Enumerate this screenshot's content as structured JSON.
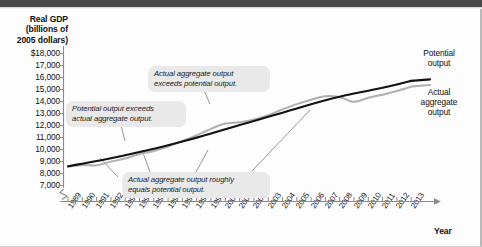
{
  "figure": {
    "y_axis_title": "Real GDP\n(billions of\n2005 dollars)",
    "x_axis_title": "Year"
  },
  "series_labels": {
    "potential": "Potential\noutput",
    "actual": "Actual\naggregate\noutput"
  },
  "callouts": {
    "left": "Potential output exceeds\nactual aggregate output.",
    "top": "Actual aggregate output\nexceeds potential output.",
    "bottom": "Actual aggregate output roughly\nequals potential output."
  },
  "colors": {
    "potential_line": "#111111",
    "actual_line": "#b0b0b0",
    "callout_bg": "#e9e9e9",
    "header_bar": "#4a4a4a",
    "axis": "#8a8a8a"
  },
  "chart_data": {
    "type": "line",
    "title": "",
    "xlabel": "Year",
    "ylabel": "Real GDP (billions of 2005 dollars)",
    "xlim": [
      1989,
      2013
    ],
    "ylim": [
      7000,
      18000
    ],
    "ytick_labels": [
      "$18,000",
      "17,000",
      "16,000",
      "15,000",
      "14,000",
      "13,000",
      "12,000",
      "11,000",
      "10,000",
      "9,000",
      "8,000",
      "7,000"
    ],
    "ytick_values": [
      18000,
      17000,
      16000,
      15000,
      14000,
      13000,
      12000,
      11000,
      10000,
      9000,
      8000,
      7000
    ],
    "axis_break": true,
    "grid": false,
    "legend": "inline-right",
    "categories": [
      1989,
      1990,
      1991,
      1992,
      1993,
      1994,
      1995,
      1996,
      1997,
      1998,
      1999,
      2000,
      2001,
      2002,
      2003,
      2004,
      2005,
      2006,
      2007,
      2008,
      2009,
      2010,
      2011,
      2012,
      2013
    ],
    "series": [
      {
        "name": "Potential output",
        "color": "#111111",
        "values": [
          8600,
          8820,
          9040,
          9270,
          9520,
          9790,
          10060,
          10350,
          10660,
          10990,
          11330,
          11690,
          12040,
          12380,
          12720,
          13070,
          13420,
          13770,
          14100,
          14400,
          14660,
          14900,
          15150,
          15420,
          15720
        ]
      },
      {
        "name": "Actual aggregate output",
        "color": "#b0b0b0",
        "values": [
          8560,
          8700,
          8690,
          8990,
          9250,
          9630,
          9880,
          10250,
          10720,
          11200,
          11720,
          12160,
          12280,
          12500,
          12850,
          13340,
          13780,
          14150,
          14440,
          14380,
          13970,
          14320,
          14570,
          14880,
          15240
        ]
      }
    ],
    "annotations": [
      {
        "text": "Potential output exceeds actual aggregate output.",
        "points_to_year": 1993
      },
      {
        "text": "Actual aggregate output exceeds potential output.",
        "points_to_year": 2000
      },
      {
        "text": "Actual aggregate output roughly equals potential output.",
        "points_to_year": 2007
      }
    ]
  }
}
